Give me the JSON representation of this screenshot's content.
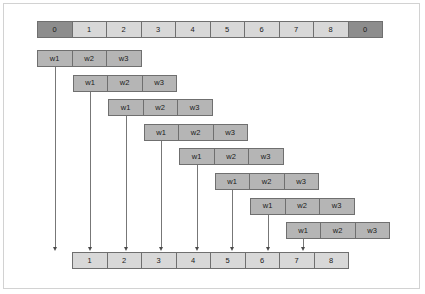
{
  "figure": {
    "colors": {
      "frame_border": "#d2d2d2",
      "cell_border": "#6f6f6f",
      "cell_light": "#d8d8d8",
      "cell_dark": "#8d8d8d",
      "window_box": "#b5b5b5",
      "arrow": "#777777",
      "background": "#ffffff"
    },
    "geometry": {
      "cell_width": 35.5,
      "cell_height": 17,
      "top_row_left": 37,
      "top_row_top": 21,
      "window_row_left_start": 37,
      "window_row_top_start": 50,
      "window_row_step_x": 35.5,
      "window_row_step_y": 24.6,
      "bottom_row_left": 72,
      "bottom_row_top": 252
    }
  },
  "top_row": {
    "name": "input-sequence-row",
    "cells": [
      {
        "label": "0",
        "shade": "dark"
      },
      {
        "label": "1",
        "shade": "light"
      },
      {
        "label": "2",
        "shade": "light"
      },
      {
        "label": "3",
        "shade": "light"
      },
      {
        "label": "4",
        "shade": "light"
      },
      {
        "label": "5",
        "shade": "light"
      },
      {
        "label": "6",
        "shade": "light"
      },
      {
        "label": "7",
        "shade": "light"
      },
      {
        "label": "8",
        "shade": "light"
      },
      {
        "label": "0",
        "shade": "dark"
      }
    ]
  },
  "window_rows": [
    {
      "index": 1,
      "cells": [
        "w1",
        "w2",
        "w3"
      ],
      "target": "1"
    },
    {
      "index": 2,
      "cells": [
        "w1",
        "w2",
        "w3"
      ],
      "target": "2"
    },
    {
      "index": 3,
      "cells": [
        "w1",
        "w2",
        "w3"
      ],
      "target": "3"
    },
    {
      "index": 4,
      "cells": [
        "w1",
        "w2",
        "w3"
      ],
      "target": "4"
    },
    {
      "index": 5,
      "cells": [
        "w1",
        "w2",
        "w3"
      ],
      "target": "5"
    },
    {
      "index": 6,
      "cells": [
        "w1",
        "w2",
        "w3"
      ],
      "target": "6"
    },
    {
      "index": 7,
      "cells": [
        "w1",
        "w2",
        "w3"
      ],
      "target": "7"
    },
    {
      "index": 8,
      "cells": [
        "w1",
        "w2",
        "w3"
      ],
      "target": "8"
    }
  ],
  "bottom_row": {
    "name": "output-sequence-row",
    "cells": [
      {
        "label": "1",
        "shade": "light"
      },
      {
        "label": "2",
        "shade": "light"
      },
      {
        "label": "3",
        "shade": "light"
      },
      {
        "label": "4",
        "shade": "light"
      },
      {
        "label": "5",
        "shade": "light"
      },
      {
        "label": "6",
        "shade": "light"
      },
      {
        "label": "7",
        "shade": "light"
      },
      {
        "label": "8",
        "shade": "light"
      }
    ]
  },
  "chart_data": {
    "type": "diagram",
    "input_sequence": [
      "0",
      "1",
      "2",
      "3",
      "4",
      "5",
      "6",
      "7",
      "8",
      "0"
    ],
    "window_size": 3,
    "window_labels": [
      "w1",
      "w2",
      "w3"
    ],
    "num_windows": 8,
    "output_sequence": [
      "1",
      "2",
      "3",
      "4",
      "5",
      "6",
      "7",
      "8"
    ],
    "mappings": [
      {
        "window": 1,
        "from": "w1",
        "to": "1"
      },
      {
        "window": 2,
        "from": "w1",
        "to": "2"
      },
      {
        "window": 3,
        "from": "w1",
        "to": "3"
      },
      {
        "window": 4,
        "from": "w1",
        "to": "4"
      },
      {
        "window": 5,
        "from": "w1",
        "to": "5"
      },
      {
        "window": 6,
        "from": "w1",
        "to": "6"
      },
      {
        "window": 7,
        "from": "w1",
        "to": "7"
      },
      {
        "window": 8,
        "from": "w1",
        "to": "8"
      }
    ]
  }
}
